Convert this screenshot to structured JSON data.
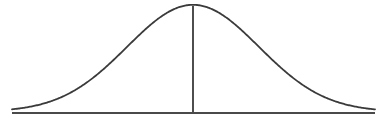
{
  "diagram": {
    "type": "normal-distribution-curve",
    "stroke_color": "#3a3a3a",
    "background_color": "#ffffff",
    "baseline": {
      "x1": 12,
      "x2": 375,
      "y": 113
    },
    "curve": {
      "mean_x": 193,
      "sigma_px": 66,
      "peak_y": 6,
      "x_start": 12,
      "x_end": 375
    },
    "mean_line": {
      "x": 193,
      "y_top": 6,
      "y_bottom": 113
    }
  }
}
